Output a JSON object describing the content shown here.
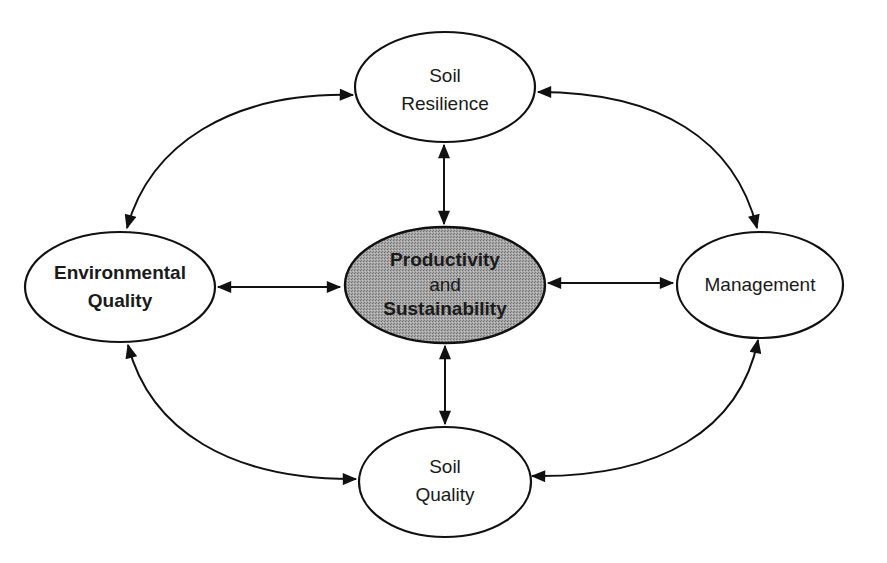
{
  "diagram": {
    "type": "concept-relationship",
    "colors": {
      "stroke": "#111111",
      "background": "#ffffff",
      "center_fill": "#9a9a9a"
    },
    "nodes": {
      "top": {
        "line1": "Soil",
        "line2": "Resilience",
        "bold": false
      },
      "left": {
        "line1": "Environmental",
        "line2": "Quality",
        "bold": true
      },
      "center": {
        "line1": "Productivity",
        "line2": "and",
        "line3": "Sustainability",
        "bold": true,
        "shaded": true
      },
      "right": {
        "line1": "Management",
        "bold": false
      },
      "bottom": {
        "line1": "Soil",
        "line2": "Quality",
        "bold": false
      }
    },
    "edges": [
      {
        "from": "Soil Resilience",
        "to": "Productivity and Sustainability",
        "style": "straight",
        "bidirectional": true
      },
      {
        "from": "Environmental Quality",
        "to": "Productivity and Sustainability",
        "style": "straight",
        "bidirectional": true
      },
      {
        "from": "Productivity and Sustainability",
        "to": "Management",
        "style": "straight",
        "bidirectional": true
      },
      {
        "from": "Productivity and Sustainability",
        "to": "Soil Quality",
        "style": "straight",
        "bidirectional": true
      },
      {
        "from": "Soil Resilience",
        "to": "Environmental Quality",
        "style": "curved",
        "bidirectional": true
      },
      {
        "from": "Soil Resilience",
        "to": "Management",
        "style": "curved",
        "bidirectional": true
      },
      {
        "from": "Environmental Quality",
        "to": "Soil Quality",
        "style": "curved",
        "bidirectional": true
      },
      {
        "from": "Management",
        "to": "Soil Quality",
        "style": "curved",
        "bidirectional": true
      }
    ]
  }
}
